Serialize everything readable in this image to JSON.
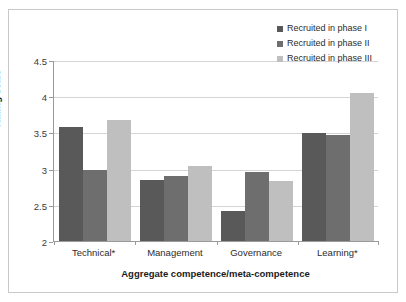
{
  "chart_data": {
    "type": "bar",
    "title": "",
    "xlabel": "Aggregate competence/meta-competence",
    "ylabel": "Rating scale",
    "ylim": [
      2,
      4.5
    ],
    "yticks": [
      "2",
      "2.5",
      "3",
      "3.5",
      "4",
      "4.5"
    ],
    "ytick_values": [
      2,
      2.5,
      3,
      3.5,
      4,
      4.5
    ],
    "grid": true,
    "legend_position": "top-right",
    "categories": [
      "Technical*",
      "Management",
      "Governance",
      "Learning*"
    ],
    "series": [
      {
        "name": "Recruited in phase I",
        "color": "#595959",
        "values": [
          3.58,
          2.84,
          2.42,
          3.49
        ]
      },
      {
        "name": "Recruited in phase II",
        "color": "#6e6e6e",
        "values": [
          2.98,
          2.9,
          2.95,
          3.47
        ]
      },
      {
        "name": "Recruited in phase III",
        "color": "#bfbfbf",
        "values": [
          3.67,
          3.04,
          2.83,
          4.04
        ]
      }
    ]
  },
  "legend": {
    "items": [
      {
        "label": "Recruited in phase I",
        "color": "#595959"
      },
      {
        "label": "Recruited in phase II",
        "color": "#6e6e6e"
      },
      {
        "label": "Recruited in phase III",
        "color": "#bfbfbf"
      }
    ]
  },
  "axes": {
    "y_title": "Rating scale",
    "x_title": "Aggregate competence/meta-competence"
  }
}
